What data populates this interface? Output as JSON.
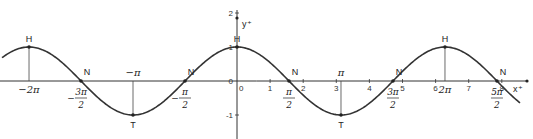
{
  "chart_data": {
    "type": "line",
    "title": "",
    "function": "cos(x)",
    "xlabel": "x",
    "ylabel": "y",
    "xlim": [
      -7.1,
      9.1
    ],
    "ylim": [
      -1.9,
      2.3
    ],
    "grid": false,
    "x_ticks": [
      {
        "value": 0,
        "label": "0"
      },
      {
        "value": 1,
        "label": "1"
      },
      {
        "value": 2,
        "label": "2"
      },
      {
        "value": 3,
        "label": "3"
      },
      {
        "value": 4,
        "label": "4"
      },
      {
        "value": 5,
        "label": "5"
      },
      {
        "value": 6,
        "label": "6"
      },
      {
        "value": 7,
        "label": "7"
      },
      {
        "value": 8,
        "label": "8"
      }
    ],
    "y_ticks": [
      {
        "value": 2,
        "label": "2"
      },
      {
        "value": 1,
        "label": "1"
      },
      {
        "value": 0,
        "label": "0"
      },
      {
        "value": -1,
        "label": "-1"
      }
    ],
    "pi_labels": [
      {
        "value": -6.2832,
        "num": "−2π",
        "den": "",
        "pos": "below"
      },
      {
        "value": -4.7124,
        "num": "3π",
        "den": "2",
        "sign": "−",
        "pos": "below"
      },
      {
        "value": -3.1416,
        "num": "−π",
        "den": "",
        "pos": "above"
      },
      {
        "value": -1.5708,
        "num": "π",
        "den": "2",
        "sign": "−",
        "pos": "below"
      },
      {
        "value": 1.5708,
        "num": "π",
        "den": "2",
        "sign": "",
        "pos": "below"
      },
      {
        "value": 3.1416,
        "num": "π",
        "den": "",
        "pos": "above"
      },
      {
        "value": 4.7124,
        "num": "3π",
        "den": "2",
        "sign": "",
        "pos": "below"
      },
      {
        "value": 6.2832,
        "num": "2π",
        "den": "",
        "pos": "below"
      },
      {
        "value": 7.854,
        "num": "5π",
        "den": "2",
        "sign": "",
        "pos": "below"
      }
    ],
    "points": [
      {
        "label": "H",
        "x": -6.2832,
        "y": 1,
        "kind": "max"
      },
      {
        "label": "N",
        "x": -4.7124,
        "y": 0,
        "kind": "zero"
      },
      {
        "label": "T",
        "x": -3.1416,
        "y": -1,
        "kind": "min"
      },
      {
        "label": "N",
        "x": -1.5708,
        "y": 0,
        "kind": "zero"
      },
      {
        "label": "H",
        "x": 0,
        "y": 1,
        "kind": "max"
      },
      {
        "label": "N",
        "x": 1.5708,
        "y": 0,
        "kind": "zero"
      },
      {
        "label": "T",
        "x": 3.1416,
        "y": -1,
        "kind": "min"
      },
      {
        "label": "N",
        "x": 4.7124,
        "y": 0,
        "kind": "zero"
      },
      {
        "label": "H",
        "x": 6.2832,
        "y": 1,
        "kind": "max"
      },
      {
        "label": "N",
        "x": 7.854,
        "y": 0,
        "kind": "zero"
      }
    ],
    "curve_domain": [
      -7.1,
      8.55
    ],
    "drop_lines_at": [
      -6.2832,
      -3.1416,
      3.1416,
      6.2832
    ]
  }
}
